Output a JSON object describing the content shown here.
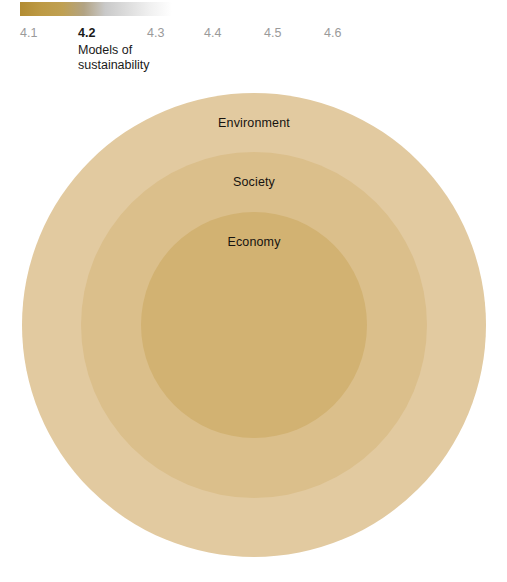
{
  "header": {
    "gradient_bar": {
      "start_color": "#b28c33",
      "end_color": "#ffffff",
      "name": "chapter-gradient-bar"
    },
    "ticks": [
      {
        "label": "4.1",
        "current": false
      },
      {
        "label": "4.2",
        "current": true
      },
      {
        "label": "4.3",
        "current": false
      },
      {
        "label": "4.4",
        "current": false
      },
      {
        "label": "4.5",
        "current": false
      },
      {
        "label": "4.6",
        "current": false
      }
    ],
    "section_caption": {
      "line1": "Models of",
      "line2": "sustainability"
    }
  },
  "diagram": {
    "title": "Models of sustainability",
    "type": "nested-circles",
    "rings": [
      {
        "label": "Environment",
        "level": 1,
        "color": "#e2caa0",
        "diameter_px": 464
      },
      {
        "label": "Society",
        "level": 2,
        "color": "#dbbf8b",
        "diameter_px": 346
      },
      {
        "label": "Economy",
        "level": 3,
        "color": "#d2b272",
        "diameter_px": 226
      }
    ]
  }
}
